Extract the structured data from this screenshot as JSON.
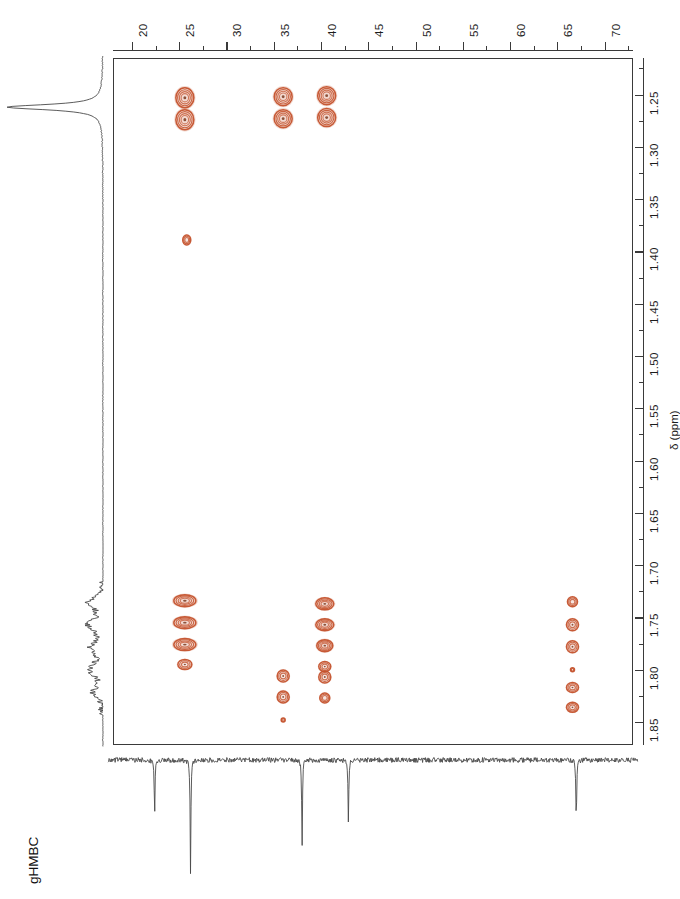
{
  "experiment": {
    "title": "gHMBC"
  },
  "axes": {
    "carbon": {
      "nucleus": "13C",
      "orientation": "top",
      "unit": "ppm",
      "direction": "increasing-right",
      "range": [
        18.0,
        73.0
      ],
      "major_ticks": [
        20,
        25,
        30,
        35,
        40,
        45,
        50,
        55,
        60,
        65,
        70
      ],
      "major_tick_labels": [
        "20",
        "25",
        "30",
        "35",
        "40",
        "45",
        "50",
        "55",
        "60",
        "65",
        "70"
      ],
      "minor_tick_step": 2.5
    },
    "proton": {
      "nucleus": "1H",
      "orientation": "right",
      "unit": "ppm",
      "axis_title": "δ (ppm)",
      "direction": "increasing-down",
      "range": [
        1.215,
        1.872
      ],
      "major_ticks": [
        1.25,
        1.3,
        1.35,
        1.4,
        1.45,
        1.5,
        1.55,
        1.6,
        1.65,
        1.7,
        1.75,
        1.8,
        1.85
      ],
      "major_tick_labels": [
        "1.25",
        "1.30",
        "1.35",
        "1.40",
        "1.45",
        "1.50",
        "1.55",
        "1.60",
        "1.65",
        "1.70",
        "1.75",
        "1.80",
        "1.85"
      ],
      "minor_tick_step": 0.025
    }
  },
  "chart_data": {
    "type": "scatter",
    "title": "gHMBC",
    "xlabel": "δ 13C (ppm)",
    "ylabel": "δ 1H (ppm)",
    "xlim": [
      18.0,
      73.0
    ],
    "ylim": [
      1.872,
      1.215
    ],
    "grid": false,
    "legend_position": "none",
    "contour_color": "#c4522c",
    "cross_peaks": [
      {
        "id": "cp1",
        "c_ppm": 25.6,
        "h_ppm": 1.253,
        "rx": 9,
        "ry": 10,
        "intensity": "strong",
        "inner": 2
      },
      {
        "id": "cp2",
        "c_ppm": 25.6,
        "h_ppm": 1.274,
        "rx": 9,
        "ry": 10,
        "intensity": "strong",
        "inner": 2
      },
      {
        "id": "cp3",
        "c_ppm": 36.0,
        "h_ppm": 1.252,
        "rx": 9,
        "ry": 9,
        "intensity": "strong",
        "inner": 2
      },
      {
        "id": "cp4",
        "c_ppm": 36.0,
        "h_ppm": 1.273,
        "rx": 9,
        "ry": 9,
        "intensity": "strong",
        "inner": 2
      },
      {
        "id": "cp5",
        "c_ppm": 40.6,
        "h_ppm": 1.251,
        "rx": 9,
        "ry": 9,
        "intensity": "strong",
        "inner": 2
      },
      {
        "id": "cp6",
        "c_ppm": 40.6,
        "h_ppm": 1.272,
        "rx": 9,
        "ry": 9,
        "intensity": "strong",
        "inner": 2
      },
      {
        "id": "cp7",
        "c_ppm": 25.8,
        "h_ppm": 1.389,
        "rx": 4,
        "ry": 5,
        "intensity": "weak",
        "inner": 1
      },
      {
        "id": "cp8",
        "c_ppm": 25.6,
        "h_ppm": 1.734,
        "rx": 11,
        "ry": 6,
        "intensity": "strong",
        "inner": 2
      },
      {
        "id": "cp9",
        "c_ppm": 25.6,
        "h_ppm": 1.755,
        "rx": 11,
        "ry": 6,
        "intensity": "strong",
        "inner": 2
      },
      {
        "id": "cp10",
        "c_ppm": 25.6,
        "h_ppm": 1.776,
        "rx": 11,
        "ry": 6,
        "intensity": "strong",
        "inner": 2
      },
      {
        "id": "cp11",
        "c_ppm": 25.6,
        "h_ppm": 1.795,
        "rx": 7,
        "ry": 5,
        "intensity": "medium",
        "inner": 1
      },
      {
        "id": "cp12",
        "c_ppm": 40.4,
        "h_ppm": 1.737,
        "rx": 9,
        "ry": 6,
        "intensity": "strong",
        "inner": 2
      },
      {
        "id": "cp13",
        "c_ppm": 40.4,
        "h_ppm": 1.757,
        "rx": 9,
        "ry": 6,
        "intensity": "strong",
        "inner": 2
      },
      {
        "id": "cp14",
        "c_ppm": 40.4,
        "h_ppm": 1.777,
        "rx": 8,
        "ry": 6,
        "intensity": "strong",
        "inner": 2
      },
      {
        "id": "cp15",
        "c_ppm": 40.4,
        "h_ppm": 1.797,
        "rx": 6,
        "ry": 5,
        "intensity": "medium",
        "inner": 1
      },
      {
        "id": "cp16",
        "c_ppm": 66.6,
        "h_ppm": 1.735,
        "rx": 5,
        "ry": 5,
        "intensity": "weak",
        "inner": 1
      },
      {
        "id": "cp17",
        "c_ppm": 66.6,
        "h_ppm": 1.757,
        "rx": 6,
        "ry": 6,
        "intensity": "medium",
        "inner": 1
      },
      {
        "id": "cp18",
        "c_ppm": 66.6,
        "h_ppm": 1.778,
        "rx": 6,
        "ry": 6,
        "intensity": "medium",
        "inner": 1
      },
      {
        "id": "cp19",
        "c_ppm": 36.0,
        "h_ppm": 1.806,
        "rx": 6,
        "ry": 6,
        "intensity": "medium",
        "inner": 1
      },
      {
        "id": "cp20",
        "c_ppm": 36.0,
        "h_ppm": 1.826,
        "rx": 6,
        "ry": 6,
        "intensity": "medium",
        "inner": 1
      },
      {
        "id": "cp21",
        "c_ppm": 36.0,
        "h_ppm": 1.848,
        "rx": 2,
        "ry": 2,
        "intensity": "weak",
        "inner": 0
      },
      {
        "id": "cp22",
        "c_ppm": 40.4,
        "h_ppm": 1.807,
        "rx": 6,
        "ry": 6,
        "intensity": "medium",
        "inner": 1
      },
      {
        "id": "cp23",
        "c_ppm": 40.4,
        "h_ppm": 1.827,
        "rx": 5,
        "ry": 5,
        "intensity": "weak",
        "inner": 1
      },
      {
        "id": "cp24",
        "c_ppm": 66.6,
        "h_ppm": 1.8,
        "rx": 2,
        "ry": 2,
        "intensity": "weak",
        "inner": 0
      },
      {
        "id": "cp25",
        "c_ppm": 66.6,
        "h_ppm": 1.817,
        "rx": 6,
        "ry": 5,
        "intensity": "medium",
        "inner": 1
      },
      {
        "id": "cp26",
        "c_ppm": 66.6,
        "h_ppm": 1.836,
        "rx": 6,
        "ry": 5,
        "intensity": "medium",
        "inner": 1
      }
    ],
    "carbon_projection": {
      "description": "1D 13C trace along bottom",
      "peaks": [
        {
          "c_ppm": 22.4,
          "height": 0.52
        },
        {
          "c_ppm": 26.2,
          "height": 1.0
        },
        {
          "c_ppm": 38.0,
          "height": 0.78
        },
        {
          "c_ppm": 42.9,
          "height": 0.57
        },
        {
          "c_ppm": 67.0,
          "height": 0.58
        }
      ],
      "baseline_noise": true
    },
    "proton_projection": {
      "description": "1D 1H trace along left side",
      "peaks": [
        {
          "h_ppm": 1.262,
          "height": 1.0,
          "shape": "sharp-singlet"
        },
        {
          "h_ppm": 1.755,
          "height": 0.22,
          "shape": "multiplet"
        },
        {
          "h_ppm": 1.8,
          "height": 0.18,
          "shape": "multiplet"
        }
      ]
    }
  }
}
